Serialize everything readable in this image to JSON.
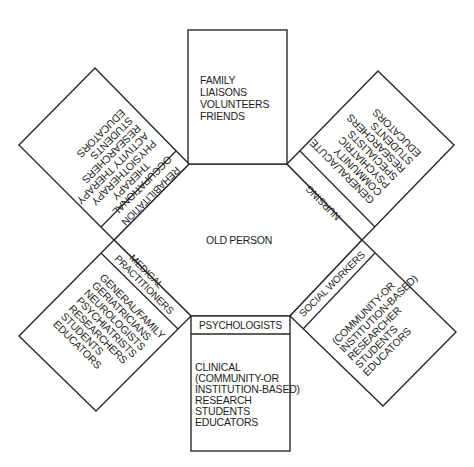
{
  "center": {
    "label": "OLD PERSON"
  },
  "groups": {
    "top": {
      "header": "",
      "items": [
        "FAMILY",
        "LIAISONS",
        "VOLUNTEERS",
        "FRIENDS"
      ]
    },
    "rehabilitation": {
      "header": "REHABILITATION",
      "items": [
        "OCCUPATIONAL",
        "THERAPY",
        "PHYSIOTHERAPY",
        "ACTIVITY THERAPY",
        "RESEARCHERS",
        "STUDENTS",
        "EDUCATORS"
      ]
    },
    "nursing": {
      "header": "NURSING",
      "items": [
        "GENERAL/ACUTE",
        "COMMUNITY",
        "PSYCHIATRIC",
        "SPECIALISTS",
        "RESEARCHERS",
        "STUDENTS",
        "EDUCATORS"
      ]
    },
    "medical": {
      "header": "MEDICAL",
      "header2": "PRACTITIONERS",
      "items": [
        "GENERAL/FAMILY",
        "GERIATRICIANS",
        "NEUROLOGISTS",
        "PSYCHIATRISTS",
        "RESEARCHERS",
        "STUDENTS",
        "EDUCATORS"
      ]
    },
    "social_workers": {
      "header": "SOCIAL WORKERS",
      "items": [
        "(COMMUNITY-OR",
        "INSTITUTION-BASED)",
        "RESEARCHER",
        "STUDENTS",
        "EDUCATORS"
      ]
    },
    "psychologists": {
      "header": "PSYCHOLOGISTS",
      "items": [
        "CLINICAL",
        "(COMMUNITY-OR",
        "INSTITUTION-BASED)",
        "RESEARCH",
        "STUDENTS",
        "EDUCATORS"
      ]
    }
  }
}
